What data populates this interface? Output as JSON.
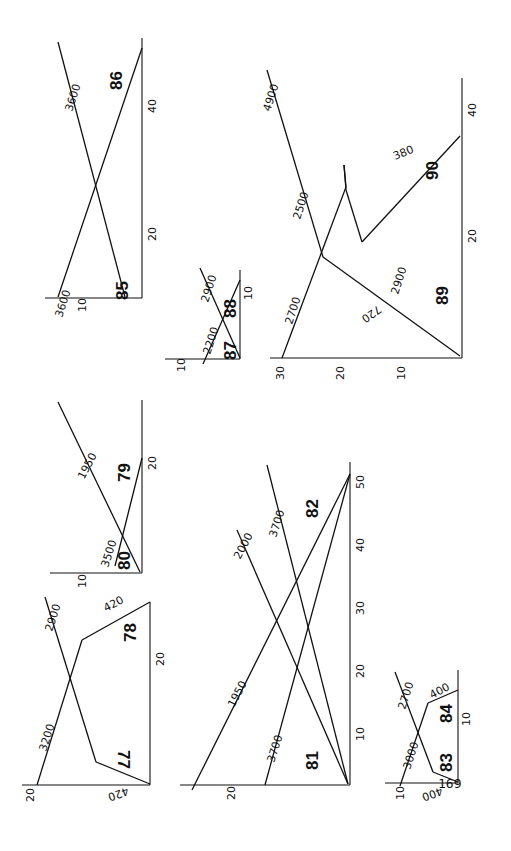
{
  "page_number": "169",
  "diagrams": {
    "d85_86": {
      "ids": [
        "85",
        "86"
      ],
      "labels": [
        "3600",
        "3600"
      ],
      "ticks": [
        "10",
        "20",
        "40"
      ]
    },
    "d87_88": {
      "ids": [
        "87",
        "88"
      ],
      "labels": [
        "2200",
        "2900"
      ],
      "ticks": [
        "10",
        "10"
      ]
    },
    "d89_90": {
      "ids": [
        "89",
        "90"
      ],
      "labels": [
        "2700",
        "720",
        "2900",
        "2500",
        "4900",
        "380"
      ],
      "ticks": [
        "30",
        "20",
        "10",
        "20",
        "40"
      ]
    },
    "d79_80": {
      "ids": [
        "79",
        "80"
      ],
      "labels": [
        "1950",
        "3500"
      ],
      "ticks": [
        "10",
        "20"
      ]
    },
    "d77_78": {
      "ids": [
        "77",
        "78"
      ],
      "labels": [
        "3200",
        "2900",
        "420",
        "420"
      ],
      "ticks": [
        "20",
        "20"
      ]
    },
    "d81_82": {
      "ids": [
        "81",
        "82"
      ],
      "labels": [
        "1950",
        "2000",
        "3700",
        "3700"
      ],
      "ticks": [
        "20",
        "10",
        "20",
        "30",
        "40",
        "50"
      ]
    },
    "d83_84": {
      "ids": [
        "83",
        "84"
      ],
      "labels": [
        "3000",
        "2700",
        "400",
        "400"
      ],
      "ticks": [
        "10",
        "10"
      ]
    }
  }
}
